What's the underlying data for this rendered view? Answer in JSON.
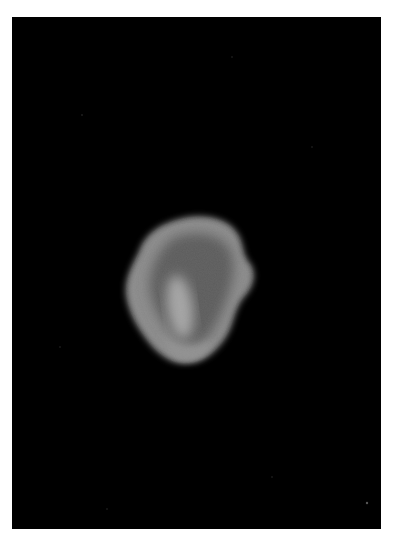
{
  "image": {
    "description": "Grayscale micrograph of a single bright irregular particle on a black background",
    "background_color": "#000000",
    "border_color": "#ffffff",
    "particle": {
      "outer_color": "#8a8a8a",
      "inner_dark_color": "#5a5a5a",
      "core_color": "#a0a0a0"
    }
  }
}
